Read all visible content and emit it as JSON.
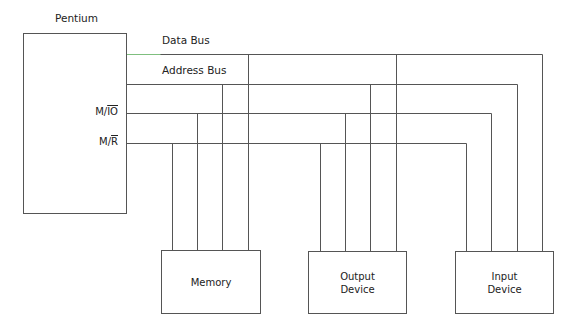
{
  "title": "Pentium",
  "colors": {
    "line": "#555555",
    "accent_line": "#7fbf7f",
    "text": "#222222",
    "background": "#ffffff"
  },
  "cpu": {
    "label": "Pentium",
    "x": 23,
    "y": 33,
    "w": 103,
    "h": 180
  },
  "buses": [
    {
      "id": "data-bus",
      "label": "Data Bus",
      "y": 54,
      "x_end": 542,
      "taps": [
        248,
        396,
        542
      ]
    },
    {
      "id": "address-bus",
      "label": "Address Bus",
      "y": 84,
      "x_end": 517,
      "taps": [
        222,
        370,
        517
      ]
    },
    {
      "id": "m-io",
      "label": "",
      "y": 113,
      "x_end": 491,
      "taps": [
        197,
        345,
        491
      ]
    },
    {
      "id": "m-r",
      "label": "",
      "y": 143,
      "x_end": 466,
      "taps": [
        172,
        320,
        466
      ]
    }
  ],
  "signals": [
    {
      "prefix": "M/",
      "overline": "IO",
      "y": 113
    },
    {
      "prefix": "M/",
      "overline": "R",
      "y": 143
    }
  ],
  "devices": [
    {
      "id": "memory",
      "lines": [
        "Memory"
      ],
      "x": 161,
      "y": 250,
      "w": 99,
      "h": 63
    },
    {
      "id": "output-device",
      "lines": [
        "Output",
        "Device"
      ],
      "x": 308,
      "y": 251,
      "w": 98,
      "h": 62
    },
    {
      "id": "input-device",
      "lines": [
        "Input",
        "Device"
      ],
      "x": 455,
      "y": 251,
      "w": 98,
      "h": 62
    }
  ],
  "bus_start_x": 126
}
